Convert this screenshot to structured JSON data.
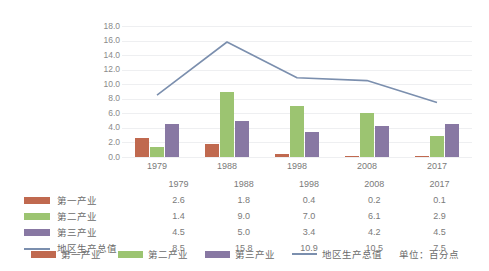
{
  "chart_data": {
    "type": "bar",
    "title": "",
    "xlabel": "",
    "ylabel": "",
    "ylim": [
      0.0,
      18.0
    ],
    "ytick_step": 2.0,
    "ytick_labels": [
      "0.0",
      "2.0",
      "4.0",
      "6.0",
      "8.0",
      "10.0",
      "12.0",
      "14.0",
      "16.0",
      "18.0"
    ],
    "grid": true,
    "legend_position": "bottom",
    "categories": [
      "1979",
      "1988",
      "1998",
      "2008",
      "2017"
    ],
    "series": [
      {
        "name": "第一产业",
        "type": "bar",
        "color": "#c0694f",
        "values": [
          2.6,
          1.8,
          0.4,
          0.2,
          0.1
        ]
      },
      {
        "name": "第二产业",
        "type": "bar",
        "color": "#9cc471",
        "values": [
          1.4,
          9.0,
          7.0,
          6.1,
          2.9
        ]
      },
      {
        "name": "第三产业",
        "type": "bar",
        "color": "#8878a3",
        "values": [
          4.5,
          5.0,
          3.4,
          4.2,
          4.5
        ]
      },
      {
        "name": "地区生产总值",
        "type": "line",
        "color": "#7b8fae",
        "values": [
          8.5,
          15.8,
          10.9,
          10.5,
          7.5
        ]
      }
    ],
    "unit_note": "单位：百分点"
  },
  "table": {
    "header": [
      "1979",
      "1988",
      "1998",
      "2008",
      "2017"
    ],
    "rows": [
      {
        "label": "第一产业",
        "values": [
          "2.6",
          "1.8",
          "0.4",
          "0.2",
          "0.1"
        ]
      },
      {
        "label": "第二产业",
        "values": [
          "1.4",
          "9.0",
          "7.0",
          "6.1",
          "2.9"
        ]
      },
      {
        "label": "第三产业",
        "values": [
          "4.5",
          "5.0",
          "3.4",
          "4.2",
          "4.5"
        ]
      },
      {
        "label": "地区生产总值",
        "values": [
          "8.5",
          "15.8",
          "10.9",
          "10.5",
          "7.5"
        ]
      }
    ]
  },
  "legend": {
    "items": [
      "第一产业",
      "第二产业",
      "第三产业",
      "地区生产总值"
    ],
    "unit": "单位：百分点"
  }
}
